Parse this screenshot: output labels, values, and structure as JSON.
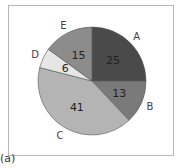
{
  "chart_data": {
    "type": "pie",
    "title": "",
    "categories": [
      "A",
      "B",
      "C",
      "D",
      "E"
    ],
    "values": [
      25,
      13,
      41,
      6,
      15
    ],
    "colors": [
      "#4a4a4a",
      "#7a7a7a",
      "#b4b4b4",
      "#e6e6e6",
      "#8c8c8c"
    ],
    "start_angle": "12 o'clock",
    "direction": "clockwise",
    "legend": "none (outside labels)"
  },
  "caption": "(a)"
}
